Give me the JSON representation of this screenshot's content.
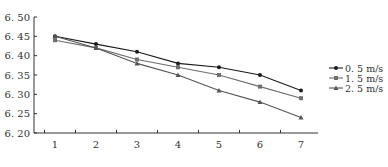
{
  "chart_data": {
    "type": "line",
    "title": "",
    "xlabel": "",
    "ylabel": "",
    "x": [
      1,
      2,
      3,
      4,
      5,
      6,
      7
    ],
    "ylim": [
      6.2,
      6.5
    ],
    "yticks": [
      "6. 20",
      "6. 25",
      "6. 30",
      "6. 35",
      "6. 40",
      "6. 45",
      "6. 50"
    ],
    "xticks": [
      "1",
      "2",
      "3",
      "4",
      "5",
      "6",
      "7"
    ],
    "grid": false,
    "legend_position": "right",
    "series": [
      {
        "name": "0. 5 m/s",
        "marker": "circle",
        "color": "#1a1a1a",
        "values": [
          6.45,
          6.43,
          6.41,
          6.38,
          6.37,
          6.35,
          6.31
        ]
      },
      {
        "name": "1. 5 m/s",
        "marker": "square",
        "color": "#6e6e6e",
        "values": [
          6.44,
          6.42,
          6.39,
          6.37,
          6.35,
          6.32,
          6.29
        ]
      },
      {
        "name": "2. 5 m/s",
        "marker": "triangle",
        "color": "#555555",
        "values": [
          6.45,
          6.42,
          6.38,
          6.35,
          6.31,
          6.28,
          6.24
        ]
      }
    ]
  }
}
